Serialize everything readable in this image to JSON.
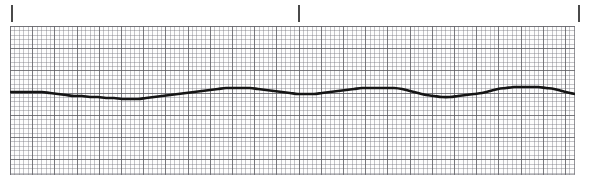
{
  "strip": {
    "title": "ECG Rhythm Strip",
    "lead_label": "",
    "paper_color": "#fdfdfd",
    "grid_minor_color": "#787880",
    "grid_major_color": "#5a5a5f",
    "trace_color": "#151515",
    "tick_color": "#4a4a4a"
  },
  "ticks": [
    {
      "name": "tick-start",
      "x": 11,
      "label": ""
    },
    {
      "name": "tick-mid",
      "x": 298,
      "label": ""
    },
    {
      "name": "tick-end",
      "x": 578,
      "label": ""
    }
  ],
  "chart_data": {
    "type": "line",
    "title": "ECG Rhythm Strip",
    "xlabel": "Time",
    "ylabel": "Amplitude",
    "grid": true,
    "legend": "none",
    "xlim": [
      0,
      565
    ],
    "ylim": [
      149,
      0
    ],
    "series": [
      {
        "name": "lead-trace",
        "x": [
          0,
          8,
          16,
          24,
          32,
          40,
          48,
          56,
          64,
          72,
          80,
          88,
          96,
          104,
          112,
          120,
          128,
          136,
          144,
          152,
          160,
          168,
          176,
          184,
          192,
          200,
          208,
          216,
          224,
          232,
          240,
          248,
          256,
          264,
          272,
          280,
          288,
          296,
          304,
          312,
          320,
          328,
          336,
          344,
          352,
          360,
          368,
          376,
          384,
          392,
          400,
          408,
          416,
          424,
          432,
          440,
          448,
          456,
          464,
          472,
          480,
          488,
          496,
          504,
          512,
          520,
          528,
          536,
          544,
          552,
          560,
          565
        ],
        "y": [
          66,
          66,
          66,
          66,
          66,
          67,
          68,
          69,
          70,
          70,
          71,
          71,
          72,
          72,
          73,
          73,
          73,
          72,
          71,
          70,
          69,
          68,
          67,
          66,
          65,
          64,
          63,
          62,
          62,
          62,
          62,
          63,
          64,
          65,
          66,
          67,
          68,
          68,
          68,
          67,
          66,
          65,
          64,
          63,
          62,
          62,
          62,
          62,
          62,
          63,
          65,
          67,
          69,
          70,
          71,
          71,
          70,
          69,
          68,
          67,
          65,
          63,
          62,
          61,
          61,
          61,
          61,
          62,
          63,
          65,
          67,
          68
        ]
      }
    ],
    "units": {
      "paper_speed": "25 mm/s",
      "gain": "10 mm/mV"
    },
    "grid_spec": {
      "minor_square_px": 4.44,
      "major_square_px": 22.2,
      "minor_per_major": 5
    }
  }
}
